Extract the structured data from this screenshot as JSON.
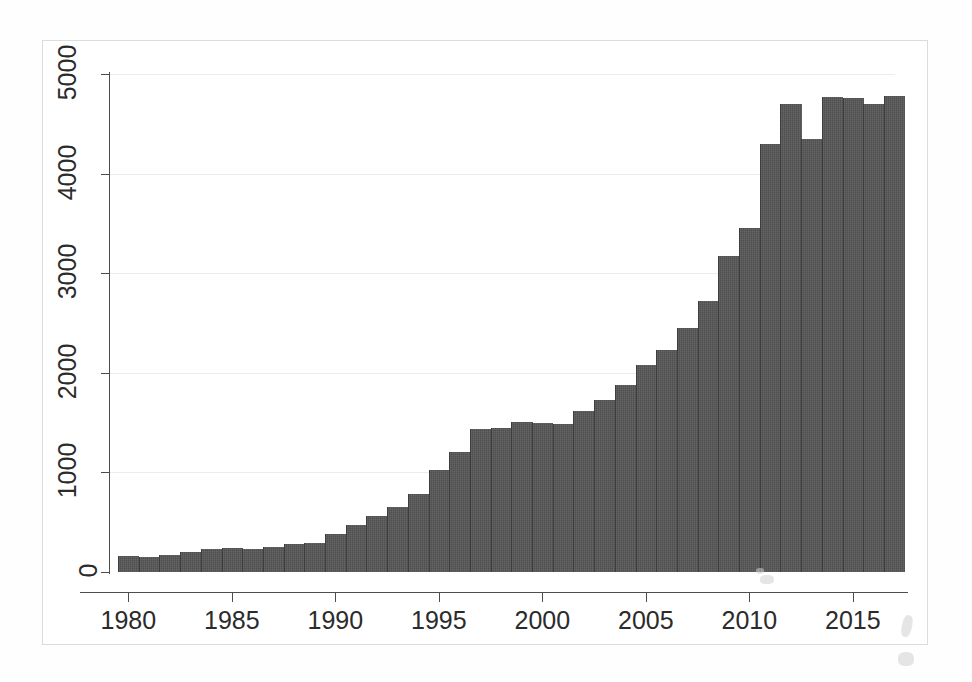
{
  "figure": {
    "alt_title": "Publications per year, 1980-2017",
    "bar_color": "#4f4f4f",
    "grid_color": "#ececec",
    "axis_color": "#4d4d4d",
    "background": "#ffffff"
  },
  "chart_data": {
    "type": "bar",
    "title": "",
    "subtitle": "",
    "xlabel": "",
    "ylabel": "",
    "xlim": [
      1979,
      2018
    ],
    "ylim": [
      0,
      5200
    ],
    "grid": true,
    "grid_axis": "y",
    "legend": false,
    "legend_position": "none",
    "x_tick_labels": [
      "1980",
      "1985",
      "1990",
      "1995",
      "2000",
      "2005",
      "2010",
      "2015"
    ],
    "x_ticks": [
      1980,
      1985,
      1990,
      1995,
      2000,
      2005,
      2010,
      2015
    ],
    "y_tick_labels": [
      "0",
      "1000",
      "2000",
      "3000",
      "4000",
      "5000"
    ],
    "y_ticks": [
      0,
      1000,
      2000,
      3000,
      4000,
      5000
    ],
    "categories": [
      1980,
      1981,
      1982,
      1983,
      1984,
      1985,
      1986,
      1987,
      1988,
      1989,
      1990,
      1991,
      1992,
      1993,
      1994,
      1995,
      1996,
      1997,
      1998,
      1999,
      2000,
      2001,
      2002,
      2003,
      2004,
      2005,
      2006,
      2007,
      2008,
      2009,
      2010,
      2011,
      2012,
      2013,
      2014,
      2015,
      2016,
      2017
    ],
    "values": [
      165,
      150,
      175,
      205,
      235,
      240,
      230,
      250,
      285,
      290,
      385,
      470,
      565,
      650,
      780,
      1020,
      1200,
      1440,
      1450,
      1510,
      1500,
      1490,
      1620,
      1730,
      1880,
      2080,
      2230,
      2450,
      2720,
      3170,
      3450,
      4300,
      4700,
      4350,
      4770,
      4760,
      4700,
      4780
    ],
    "series_name": "count"
  }
}
